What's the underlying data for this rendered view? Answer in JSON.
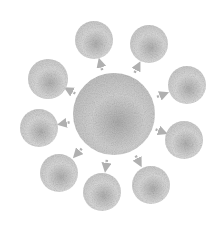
{
  "diagram": {
    "type": "hub-and-spoke",
    "background": "#ffffff",
    "colors": {
      "fill_light": "#e4e4e4",
      "fill_mid": "#c4c4c4",
      "fill_dark": "#9a9a9a",
      "arrow": "#b0b0b0"
    },
    "hub": {
      "cx": 114,
      "cy": 114,
      "r": 41
    },
    "nodes": [
      {
        "id": "top-left",
        "cx": 94,
        "cy": 40,
        "r": 19
      },
      {
        "id": "top-right",
        "cx": 149,
        "cy": 44,
        "r": 19
      },
      {
        "id": "right-upper",
        "cx": 187,
        "cy": 85,
        "r": 19
      },
      {
        "id": "right-lower",
        "cx": 184,
        "cy": 140,
        "r": 19
      },
      {
        "id": "bottom-right",
        "cx": 151,
        "cy": 185,
        "r": 19
      },
      {
        "id": "bottom-middle",
        "cx": 102,
        "cy": 192,
        "r": 19
      },
      {
        "id": "bottom-left",
        "cx": 59,
        "cy": 173,
        "r": 19
      },
      {
        "id": "left-middle",
        "cx": 39,
        "cy": 128,
        "r": 19
      },
      {
        "id": "left-upper",
        "cx": 48,
        "cy": 79,
        "r": 20
      }
    ],
    "arrows": [
      {
        "from": "hub",
        "to": "top-left"
      },
      {
        "from": "hub",
        "to": "top-right"
      },
      {
        "from": "hub",
        "to": "right-upper"
      },
      {
        "from": "hub",
        "to": "right-lower"
      },
      {
        "from": "hub",
        "to": "bottom-right"
      },
      {
        "from": "hub",
        "to": "bottom-middle"
      },
      {
        "from": "hub",
        "to": "bottom-left"
      },
      {
        "from": "hub",
        "to": "left-middle"
      },
      {
        "from": "hub",
        "to": "left-upper"
      }
    ]
  }
}
